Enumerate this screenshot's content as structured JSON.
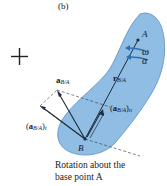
{
  "figure": {
    "panel_label": "(b)",
    "operator": "+",
    "caption_line1": "Rotation about the",
    "caption_line2": "base point A",
    "points": {
      "A": "A",
      "B": "B"
    },
    "symbols": {
      "omega": "ω",
      "alpha": "α"
    },
    "vectors": {
      "r": {
        "main": "r",
        "sub": "B/A"
      },
      "a": {
        "main": "a",
        "sub": "B/A"
      },
      "at": {
        "open": "(",
        "main": "a",
        "sub": "B/A",
        "close": ")",
        "sub2": "t"
      },
      "an": {
        "open": "(",
        "main": "a",
        "sub": "B/A",
        "close": ")",
        "sub2": "n"
      }
    },
    "colors": {
      "body_fill": "#8fbde3",
      "body_stroke": "#5a8fc4",
      "vector": "#1c2b3a",
      "rotation_arrow": "#2f6fb5"
    }
  }
}
